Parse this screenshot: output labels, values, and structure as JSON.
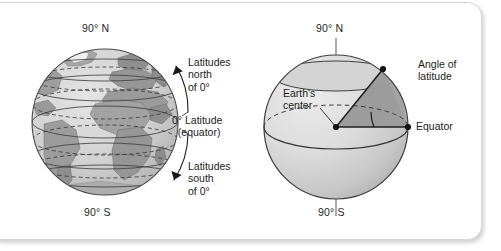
{
  "figure": {
    "kind": "latitude-diagram",
    "card_background": "#ffffff",
    "border_color": "#d8d8d8"
  },
  "left_panel": {
    "name": "earth-globe-latitudes",
    "pole_north": "90° N",
    "pole_south": "90° S",
    "callouts": {
      "north": "Latitudes\nnorth\nof 0°",
      "equator": "0° Latitude\n  (equator)",
      "south": "Latitudes\nsouth\nof 0°"
    },
    "globe": {
      "center_x": 105,
      "center_y": 122,
      "radius": 73,
      "ocean_color": "#d2d2d2",
      "land_color": "#9a9a9a",
      "outline_color": "#4a4a4a",
      "parallel_count": 6,
      "parallel_offsets": [
        -52,
        -34,
        -16,
        0,
        18,
        38,
        56
      ],
      "dashed_parallel_offsets": [
        -44,
        -25,
        27,
        47
      ],
      "bracket_arrow_color": "#1a1a1a"
    }
  },
  "right_panel": {
    "name": "angle-of-latitude-globe",
    "pole_north": "90° N",
    "pole_south": "90° S",
    "callouts": {
      "angle_of_latitude": "Angle of\nlatitude",
      "earths_center": "Earth's\ncenter",
      "equator": "Equator"
    },
    "globe": {
      "center_x": 336,
      "center_y": 127,
      "radius": 72,
      "fill_light": "#e2e2e2",
      "fill_dark": "#b9b9b9",
      "wedge_color": "#9e9e9e",
      "outline_color": "#3d3d3d",
      "axis_color": "#8d8d8d",
      "dot_color": "#1a1a1a",
      "latitude_point_angle_deg": 45,
      "equator_point_on_rim": true
    }
  }
}
